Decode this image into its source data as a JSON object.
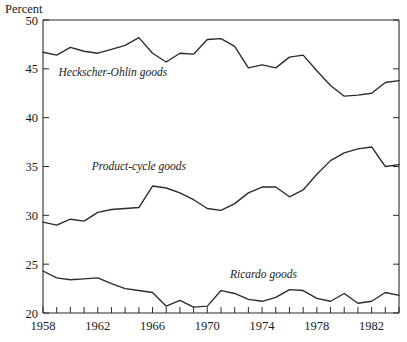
{
  "chart_data": {
    "type": "line",
    "title": "",
    "subtitle": "",
    "xlabel": "",
    "ylabel": "Percent",
    "ylabel_position": "top-left",
    "xlim": [
      1958,
      1984
    ],
    "ylim": [
      20,
      50
    ],
    "ytick_labels": [
      "50",
      "45",
      "40",
      "35",
      "30",
      "25",
      "20"
    ],
    "ytick_values": [
      50,
      45,
      40,
      35,
      30,
      25,
      20
    ],
    "xtick_labels": [
      "1958",
      "1962",
      "1966",
      "1970",
      "1974",
      "1978",
      "1982"
    ],
    "xtick_values": [
      1958,
      1962,
      1966,
      1970,
      1974,
      1978,
      1982
    ],
    "minor_xticks_every_year": true,
    "grid": false,
    "legend": "inline-annotations",
    "line_color": "#2b2b2b",
    "background_color": "#ffffff",
    "x": [
      1958,
      1959,
      1960,
      1961,
      1962,
      1963,
      1964,
      1965,
      1966,
      1967,
      1968,
      1969,
      1970,
      1971,
      1972,
      1973,
      1974,
      1975,
      1976,
      1977,
      1978,
      1979,
      1980,
      1981,
      1982,
      1983,
      1984
    ],
    "series": [
      {
        "name": "Heckscher-Ohlin goods",
        "label": "Heckscher-Ohlin goods",
        "label_x": 1963.1,
        "label_y": 44.3,
        "values": [
          46.7,
          46.4,
          47.2,
          46.8,
          46.6,
          47.0,
          47.4,
          48.2,
          46.6,
          45.7,
          46.6,
          46.5,
          48.0,
          48.1,
          47.3,
          45.1,
          45.4,
          45.1,
          46.2,
          46.4,
          44.8,
          43.3,
          42.2,
          42.3,
          42.5,
          43.6,
          43.8
        ]
      },
      {
        "name": "Product-cycle goods",
        "label": "Product-cycle goods",
        "label_x": 1965.0,
        "label_y": 34.6,
        "values": [
          29.3,
          29.0,
          29.6,
          29.4,
          30.3,
          30.6,
          30.7,
          30.8,
          33.0,
          32.8,
          32.3,
          31.6,
          30.7,
          30.5,
          31.2,
          32.3,
          32.9,
          32.9,
          31.9,
          32.6,
          34.2,
          35.6,
          36.4,
          36.8,
          37.0,
          35.0,
          35.2
        ]
      },
      {
        "name": "Ricardo goods",
        "label": "Ricardo goods",
        "label_x": 1974.1,
        "label_y": 23.6,
        "values": [
          24.3,
          23.6,
          23.4,
          23.5,
          23.6,
          23.0,
          22.5,
          22.3,
          22.1,
          20.7,
          21.3,
          20.6,
          20.7,
          22.3,
          22.0,
          21.4,
          21.2,
          21.6,
          22.4,
          22.3,
          21.5,
          21.2,
          22.0,
          21.0,
          21.2,
          22.1,
          21.8
        ]
      }
    ]
  }
}
